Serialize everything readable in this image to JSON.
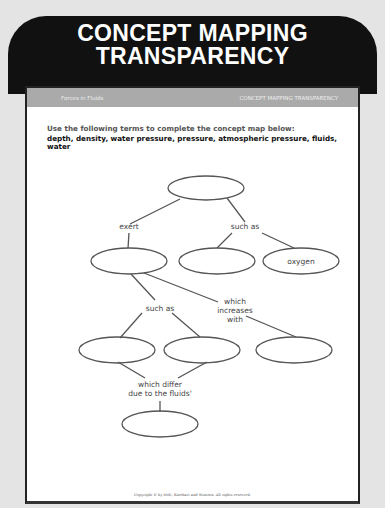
{
  "banner": {
    "title_line1": "CONCEPT MAPPING",
    "title_line2": "TRANSPARENCY"
  },
  "header_bar": {
    "left": "Forces in Fluids",
    "right": "CONCEPT MAPPING TRANSPARENCY"
  },
  "instructions": "Use the following terms to complete the concept map below:",
  "terms": "depth, density, water pressure, pressure, atmospheric pressure, fluids, water",
  "concept_map": {
    "nodes": [
      {
        "id": "top",
        "text": ""
      },
      {
        "id": "left-mid",
        "text": ""
      },
      {
        "id": "center-mid",
        "text": ""
      },
      {
        "id": "oxygen",
        "text": "oxygen"
      },
      {
        "id": "low-left",
        "text": ""
      },
      {
        "id": "low-center",
        "text": ""
      },
      {
        "id": "low-right",
        "text": ""
      },
      {
        "id": "bottom",
        "text": ""
      }
    ],
    "links": {
      "exert": "exert",
      "such_as_1": "such as",
      "such_as_2": "such as",
      "increases_1": "which",
      "increases_2": "increases",
      "increases_3": "with",
      "differ_1": "which differ",
      "differ_2": "due to the fluids'"
    }
  },
  "copyright": "Copyright © by Holt, Rinehart and Winston. All rights reserved."
}
